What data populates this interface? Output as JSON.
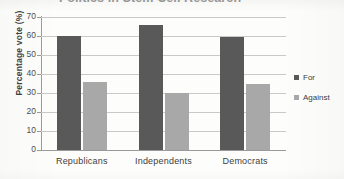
{
  "chart_data": {
    "type": "bar",
    "title": "Politics in Stem Cell Research",
    "xlabel": "",
    "ylabel": "Percentage vote (%)",
    "categories": [
      "Republicans",
      "Independents",
      "Democrats"
    ],
    "series": [
      {
        "name": "For",
        "color": "#595959",
        "values": [
          60,
          66,
          59.5
        ]
      },
      {
        "name": "Against",
        "color": "#a8a8a8",
        "values": [
          36,
          30,
          35
        ]
      }
    ],
    "ylim": [
      0,
      70
    ],
    "ytick_labels": [
      "70",
      "60",
      "50",
      "40",
      "30",
      "20",
      "10",
      "0"
    ],
    "ytick_values": [
      70,
      60,
      50,
      40,
      30,
      20,
      10,
      0
    ],
    "grid": true,
    "legend_position": "right",
    "legend": [
      {
        "label": "For",
        "swatch": "dark-gray-square"
      },
      {
        "label": "Against",
        "swatch": "light-gray-square"
      }
    ]
  },
  "axis": {
    "y_title": "Percentage vote (%)"
  },
  "legend": {
    "entries": [
      {
        "label": "For"
      },
      {
        "label": "Against"
      }
    ]
  }
}
